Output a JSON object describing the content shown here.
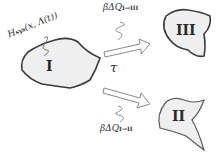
{
  "diagram": {
    "regions": [
      {
        "id": "I",
        "label": "I"
      },
      {
        "id": "II",
        "label": "II"
      },
      {
        "id": "III",
        "label": "III"
      }
    ],
    "hamiltonian": {
      "label": "H",
      "subscript": "sys",
      "args": "(x, Λ(t))"
    },
    "transition_label": "τ",
    "heat_upper": {
      "prefix": "βΔQ",
      "subscript": "I→III"
    },
    "heat_lower": {
      "prefix": "βΔQ",
      "subscript": "I→II"
    },
    "colors": {
      "fill": "#efefef",
      "stroke": "#3a3a3a",
      "arrow": "#8a8a8a"
    }
  }
}
